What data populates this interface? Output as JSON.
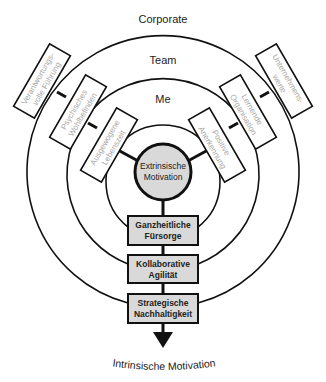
{
  "rings": [
    {
      "id": "corporate",
      "label": "Corporate"
    },
    {
      "id": "team",
      "label": "Team"
    },
    {
      "id": "me",
      "label": "Me"
    }
  ],
  "center": {
    "line1": "Extrinsische",
    "line2": "Motivation"
  },
  "left_boxes": [
    {
      "ring": "corporate",
      "line1": "Verantwortungs-",
      "line2": "volle Führung"
    },
    {
      "ring": "team",
      "line1": "Psychisches",
      "line2": "Wohlbefinden"
    },
    {
      "ring": "me",
      "line1": "Ausgewogene",
      "line2": "Lebenszeit"
    }
  ],
  "right_boxes": [
    {
      "ring": "me",
      "line1": "Positive",
      "line2": "Anerkennung"
    },
    {
      "ring": "team",
      "line1": "Lernende",
      "line2": "Organisation"
    },
    {
      "ring": "corporate",
      "line1": "Unternehmens-",
      "line2": "werte"
    }
  ],
  "stack_boxes": [
    {
      "ring": "me",
      "line1": "Ganzheitliche",
      "line2": "Fürsorge"
    },
    {
      "ring": "team",
      "line1": "Kollaborative",
      "line2": "Agilität"
    },
    {
      "ring": "corporate",
      "line1": "Strategische",
      "line2": "Nachhaltigkeit"
    }
  ],
  "outcome": {
    "label": "Intrinsische Motivation"
  }
}
